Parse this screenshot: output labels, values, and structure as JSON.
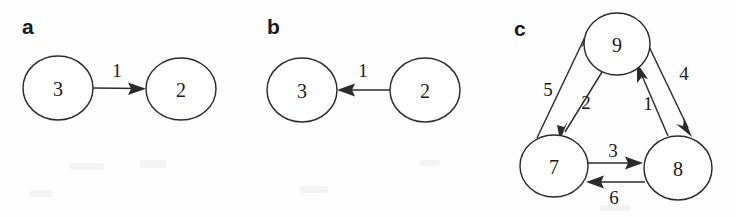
{
  "figure": {
    "background_color": "#fefefe",
    "ink_color": "#2b2b2b",
    "panels": [
      {
        "label": "a",
        "nodes": [
          {
            "id": "a-node-3",
            "text": "3",
            "cx": 58,
            "cy": 88,
            "rx": 35,
            "ry": 32
          },
          {
            "id": "a-node-2",
            "text": "2",
            "cx": 181,
            "cy": 89,
            "rx": 35,
            "ry": 31
          }
        ],
        "edges": [
          {
            "id": "a-edge-3-8-2",
            "from": "3",
            "to": "2",
            "weight": "1",
            "label_x": 117,
            "label_y": 70
          }
        ]
      },
      {
        "label": "b",
        "nodes": [
          {
            "id": "b-node-3",
            "text": "3",
            "cx": 57,
            "cy": 90,
            "rx": 35,
            "ry": 32
          },
          {
            "id": "b-node-2",
            "text": "2",
            "cx": 180,
            "cy": 90,
            "rx": 35,
            "ry": 32
          }
        ],
        "edges": [
          {
            "id": "b-edge-2-8-3",
            "from": "2",
            "to": "3",
            "weight": "1",
            "label_x": 118,
            "label_y": 70
          }
        ]
      },
      {
        "label": "c",
        "nodes": [
          {
            "id": "c-node-9",
            "text": "9",
            "cx": 127,
            "cy": 44,
            "rx": 33,
            "ry": 31
          },
          {
            "id": "c-node-7",
            "text": "7",
            "cx": 64,
            "cy": 166,
            "rx": 34,
            "ry": 31
          },
          {
            "id": "c-node-8",
            "text": "8",
            "cx": 188,
            "cy": 168,
            "rx": 34,
            "ry": 32
          }
        ],
        "edges": [
          {
            "id": "c-edge-7-8-9",
            "from": "7",
            "to": "9",
            "weight": "5",
            "label_x": 58,
            "label_y": 89
          },
          {
            "id": "c-edge-9-8-7",
            "from": "9",
            "to": "7",
            "weight": "2",
            "label_x": 96,
            "label_y": 102
          },
          {
            "id": "c-edge-8-8-9",
            "from": "8",
            "to": "9",
            "weight": "1",
            "label_x": 158,
            "label_y": 103
          },
          {
            "id": "c-edge-9-8-8",
            "from": "9",
            "to": "8",
            "weight": "4",
            "label_x": 194,
            "label_y": 73
          },
          {
            "id": "c-edge-7-8-8",
            "from": "7",
            "to": "8",
            "weight": "3",
            "label_x": 123,
            "label_y": 150
          },
          {
            "id": "c-edge-8-8-7",
            "from": "8",
            "to": "7",
            "weight": "6",
            "label_x": 124,
            "label_y": 197
          }
        ]
      }
    ]
  }
}
